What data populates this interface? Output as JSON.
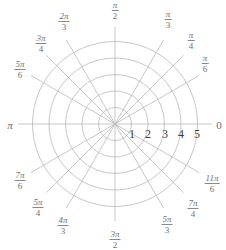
{
  "chart_data": {
    "type": "polar-grid",
    "title": "",
    "center": [
      115,
      124
    ],
    "radial_step_px": 16.5,
    "rings": [
      1,
      2,
      3,
      4,
      5
    ],
    "radial_tick_labels": [
      "1",
      "2",
      "3",
      "4",
      "5"
    ],
    "ray_length_px": 97,
    "angle_labels": [
      {
        "angle_deg": 0,
        "num": "",
        "den": "",
        "text": "0"
      },
      {
        "angle_deg": 30,
        "num": "π",
        "den": "6"
      },
      {
        "angle_deg": 45,
        "num": "π",
        "den": "4"
      },
      {
        "angle_deg": 60,
        "num": "π",
        "den": "3"
      },
      {
        "angle_deg": 90,
        "num": "π",
        "den": "2"
      },
      {
        "angle_deg": 120,
        "num": "2π",
        "den": "3"
      },
      {
        "angle_deg": 135,
        "num": "3π",
        "den": "4"
      },
      {
        "angle_deg": 150,
        "num": "5π",
        "den": "6"
      },
      {
        "angle_deg": 180,
        "num": "",
        "den": "",
        "text": "π"
      },
      {
        "angle_deg": 210,
        "num": "7π",
        "den": "6"
      },
      {
        "angle_deg": 225,
        "num": "5π",
        "den": "4"
      },
      {
        "angle_deg": 240,
        "num": "4π",
        "den": "3"
      },
      {
        "angle_deg": 270,
        "num": "3π",
        "den": "2"
      },
      {
        "angle_deg": 300,
        "num": "5π",
        "den": "3"
      },
      {
        "angle_deg": 315,
        "num": "7π",
        "den": "4"
      },
      {
        "angle_deg": 330,
        "num": "11π",
        "den": "6"
      }
    ],
    "grid": true,
    "legend": null
  },
  "labels": {
    "a0": "0",
    "a30n": "π",
    "a30d": "6",
    "a45n": "π",
    "a45d": "4",
    "a60n": "π",
    "a60d": "3",
    "a90n": "π",
    "a90d": "2",
    "a120n": "2π",
    "a120d": "3",
    "a135n": "3π",
    "a135d": "4",
    "a150n": "5π",
    "a150d": "6",
    "a180": "π",
    "a210n": "7π",
    "a210d": "6",
    "a225n": "5π",
    "a225d": "4",
    "a240n": "4π",
    "a240d": "3",
    "a270n": "3π",
    "a270d": "2",
    "a300n": "5π",
    "a300d": "3",
    "a315n": "7π",
    "a315d": "4",
    "a330n": "11π",
    "a330d": "6",
    "r1": "1",
    "r2": "2",
    "r3": "3",
    "r4": "4",
    "r5": "5"
  },
  "colors": {
    "grid": "#b9b9b9",
    "label": "#6e6e6e",
    "radial_numbers": "#3a3a3a"
  }
}
